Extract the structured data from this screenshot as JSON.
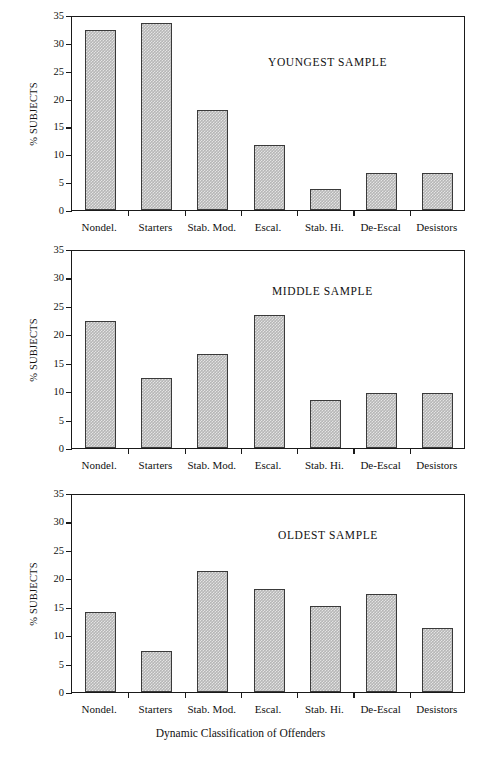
{
  "figure": {
    "axis_title_x": "Dynamic Classification of Offenders",
    "axis_title_y": "% SUBJECTS",
    "bar_fill": "#b6b6b6",
    "bar_stroke": "#3a3a3a",
    "axis_color": "#1a1a1a"
  },
  "chart_data": [
    {
      "type": "bar",
      "title": "YOUNGEST SAMPLE",
      "xlabel": "",
      "ylabel": "% SUBJECTS",
      "ylim": [
        0,
        35
      ],
      "yticks": [
        0,
        5,
        10,
        15,
        20,
        25,
        30,
        35
      ],
      "grid": false,
      "legend": "none",
      "categories": [
        "Nondel.",
        "Starters",
        "Stab. Mod.",
        "Escal.",
        "Stab. Hi.",
        "De-Escal",
        "Desistors"
      ],
      "values": [
        32.3,
        33.5,
        18.0,
        11.7,
        3.7,
        6.6,
        6.6
      ]
    },
    {
      "type": "bar",
      "title": "MIDDLE SAMPLE",
      "xlabel": "",
      "ylabel": "% SUBJECTS",
      "ylim": [
        0,
        35
      ],
      "yticks": [
        0,
        5,
        10,
        15,
        20,
        25,
        30,
        35
      ],
      "grid": false,
      "legend": "none",
      "categories": [
        "Nondel.",
        "Starters",
        "Stab. Mod.",
        "Escal.",
        "Stab. Hi.",
        "De-Escal",
        "Desistors"
      ],
      "values": [
        22.3,
        12.4,
        16.5,
        23.4,
        8.5,
        9.6,
        9.6
      ]
    },
    {
      "type": "bar",
      "title": "OLDEST SAMPLE",
      "xlabel": "Dynamic Classification of Offenders",
      "ylabel": "% SUBJECTS",
      "ylim": [
        0,
        35
      ],
      "yticks": [
        0,
        5,
        10,
        15,
        20,
        25,
        30,
        35
      ],
      "grid": false,
      "legend": "none",
      "categories": [
        "Nondel.",
        "Starters",
        "Stab. Mod.",
        "Escal.",
        "Stab. Hi.",
        "De-Escal",
        "Desistors"
      ],
      "values": [
        14.1,
        7.3,
        21.3,
        18.1,
        15.2,
        17.2,
        11.3
      ]
    }
  ]
}
